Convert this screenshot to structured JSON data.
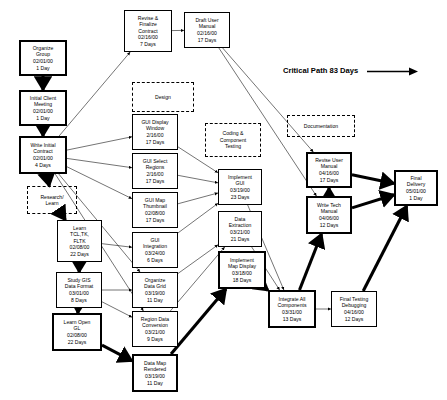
{
  "diagram": {
    "legend": {
      "label": "Critical Path 83 Days",
      "arrow_icon": "right-arrow-icon",
      "x": 283,
      "y": 66
    },
    "phases": [
      {
        "id": "design",
        "label": "Design",
        "x": 132,
        "y": 82,
        "w": 62,
        "h": 30
      },
      {
        "id": "coding",
        "label": "Coding &\nComponent\nTesting",
        "x": 205,
        "y": 123,
        "w": 56,
        "h": 34
      },
      {
        "id": "docs",
        "label": "Documentation",
        "x": 287,
        "y": 115,
        "w": 68,
        "h": 22
      }
    ],
    "nodes": [
      {
        "id": "organize_group",
        "name": "Organize\nGroup",
        "date": "02/01/00",
        "days": "1 Day",
        "x": 19,
        "y": 40,
        "w": 48,
        "h": 36,
        "critical": true
      },
      {
        "id": "initial_meeting",
        "name": "Initial Client\nMeeting",
        "date": "02/01/00",
        "days": "1 Day",
        "x": 19,
        "y": 90,
        "w": 48,
        "h": 36,
        "critical": true
      },
      {
        "id": "write_contract",
        "name": "Write Initial\nContract",
        "date": "02/01/00",
        "days": "4 Days",
        "x": 19,
        "y": 136,
        "w": 48,
        "h": 38,
        "critical": true
      },
      {
        "id": "revise_contract",
        "name": "Revise &\nFinalize\nContract",
        "date": "02/16/00",
        "days": "7 Days",
        "x": 124,
        "y": 10,
        "w": 48,
        "h": 42,
        "critical": false
      },
      {
        "id": "draft_manual",
        "name": "Draft User\nManual",
        "date": "02/16/00",
        "days": "17 Days",
        "x": 184,
        "y": 12,
        "w": 46,
        "h": 36,
        "critical": false
      },
      {
        "id": "research_learn",
        "name": "Research/\nLearn",
        "date": "",
        "days": "",
        "x": 27,
        "y": 186,
        "w": 50,
        "h": 28,
        "critical": false,
        "dashed": true
      },
      {
        "id": "learn_tcl",
        "name": "Learn\nTCL,TK,\nFLTK",
        "date": "02/08/00",
        "days": "22 Days",
        "x": 57,
        "y": 220,
        "w": 45,
        "h": 42,
        "critical": false
      },
      {
        "id": "study_gis",
        "name": "Study GIS\nData Format",
        "date": "03/01/00",
        "days": "8 Days",
        "x": 56,
        "y": 272,
        "w": 46,
        "h": 36,
        "critical": false
      },
      {
        "id": "learn_opengl",
        "name": "Learn Open\nGL",
        "date": "02/08/00",
        "days": "22 Days",
        "x": 52,
        "y": 313,
        "w": 50,
        "h": 38,
        "critical": true
      },
      {
        "id": "gui_display",
        "name": "GUI Display\nWindow",
        "date": "2/16/00",
        "days": "17 Days",
        "x": 132,
        "y": 114,
        "w": 46,
        "h": 36,
        "critical": false
      },
      {
        "id": "gui_select",
        "name": "GUI Select\nRegions",
        "date": "2/16/00",
        "days": "17 Days",
        "x": 132,
        "y": 153,
        "w": 46,
        "h": 36,
        "critical": false
      },
      {
        "id": "gui_thumbnail",
        "name": "GUI Map\nThumbnail",
        "date": "02/08/00",
        "days": "17 Days",
        "x": 132,
        "y": 192,
        "w": 46,
        "h": 36,
        "critical": false
      },
      {
        "id": "gui_integration",
        "name": "GUI\nIntegration",
        "date": "03/24/00",
        "days": "6 Days",
        "x": 132,
        "y": 232,
        "w": 46,
        "h": 36,
        "critical": false
      },
      {
        "id": "organize_grid",
        "name": "Organize\nData Grid",
        "date": "03/19/00",
        "days": "11 Day",
        "x": 132,
        "y": 272,
        "w": 46,
        "h": 36,
        "critical": false
      },
      {
        "id": "region_conv",
        "name": "Region Data\nConversion",
        "date": "03/21/00",
        "days": "9 Days",
        "x": 132,
        "y": 311,
        "w": 46,
        "h": 36,
        "critical": false
      },
      {
        "id": "data_map_render",
        "name": "Data Map\nRendered",
        "date": "03/19/00",
        "days": "11 Day",
        "x": 132,
        "y": 354,
        "w": 46,
        "h": 38,
        "critical": true
      },
      {
        "id": "implement_gui",
        "name": "Implement\nGUI",
        "date": "03/19/00",
        "days": "23 Days",
        "x": 218,
        "y": 169,
        "w": 44,
        "h": 36,
        "critical": false
      },
      {
        "id": "data_extraction",
        "name": "Data\nExtraction",
        "date": "03/21/00",
        "days": "21 Days",
        "x": 218,
        "y": 211,
        "w": 44,
        "h": 36,
        "critical": false
      },
      {
        "id": "implement_map",
        "name": "Implement\nMap Display",
        "date": "03/18/00",
        "days": "18 Days",
        "x": 218,
        "y": 251,
        "w": 48,
        "h": 38,
        "critical": true
      },
      {
        "id": "integrate_all",
        "name": "Integrate All\nComponents",
        "date": "03/31/00",
        "days": "13 Days",
        "x": 268,
        "y": 290,
        "w": 48,
        "h": 38,
        "critical": true
      },
      {
        "id": "final_testing",
        "name": "Final Testing\nDebugging",
        "date": "04/16/00",
        "days": "12 Days",
        "x": 331,
        "y": 291,
        "w": 46,
        "h": 36,
        "critical": false
      },
      {
        "id": "revise_user_man",
        "name": "Revise User\nManual",
        "date": "04/16/00",
        "days": "17 Days",
        "x": 306,
        "y": 152,
        "w": 46,
        "h": 36,
        "critical": true
      },
      {
        "id": "write_tech_man",
        "name": "Write Tech\nManual",
        "date": "04/06/00",
        "days": "12 Days",
        "x": 306,
        "y": 196,
        "w": 46,
        "h": 38,
        "critical": true
      },
      {
        "id": "final_delivery",
        "name": "Final\nDelivery",
        "date": "05/01/00",
        "days": "1 Day",
        "x": 394,
        "y": 170,
        "w": 44,
        "h": 36,
        "critical": true
      }
    ],
    "edges": [
      {
        "from": "organize_group",
        "to": "initial_meeting",
        "critical": true
      },
      {
        "from": "initial_meeting",
        "to": "write_contract",
        "critical": true
      },
      {
        "from": "write_contract",
        "to": "revise_contract",
        "critical": false
      },
      {
        "from": "revise_contract",
        "to": "draft_manual",
        "critical": false
      },
      {
        "from": "write_contract",
        "to": "research_learn",
        "critical": true
      },
      {
        "from": "write_contract",
        "to": "gui_display",
        "critical": false
      },
      {
        "from": "write_contract",
        "to": "gui_select",
        "critical": false
      },
      {
        "from": "write_contract",
        "to": "gui_thumbnail",
        "critical": false
      },
      {
        "from": "write_contract",
        "to": "organize_grid",
        "critical": false
      },
      {
        "from": "write_contract",
        "to": "region_conv",
        "critical": false
      },
      {
        "from": "research_learn",
        "to": "learn_tcl",
        "critical": true
      },
      {
        "from": "learn_tcl",
        "to": "study_gis",
        "critical": true
      },
      {
        "from": "study_gis",
        "to": "learn_opengl",
        "critical": true
      },
      {
        "from": "learn_opengl",
        "to": "data_map_render",
        "critical": true
      },
      {
        "from": "learn_tcl",
        "to": "gui_integration",
        "critical": false
      },
      {
        "from": "study_gis",
        "to": "organize_grid",
        "critical": false
      },
      {
        "from": "study_gis",
        "to": "region_conv",
        "critical": false
      },
      {
        "from": "gui_display",
        "to": "implement_gui",
        "critical": false
      },
      {
        "from": "gui_select",
        "to": "implement_gui",
        "critical": false
      },
      {
        "from": "gui_thumbnail",
        "to": "implement_gui",
        "critical": false
      },
      {
        "from": "gui_integration",
        "to": "implement_gui",
        "critical": false
      },
      {
        "from": "organize_grid",
        "to": "data_extraction",
        "critical": false
      },
      {
        "from": "region_conv",
        "to": "data_extraction",
        "critical": false
      },
      {
        "from": "data_map_render",
        "to": "implement_map",
        "critical": true
      },
      {
        "from": "implement_map",
        "to": "integrate_all",
        "critical": true
      },
      {
        "from": "implement_gui",
        "to": "integrate_all",
        "critical": false
      },
      {
        "from": "data_extraction",
        "to": "integrate_all",
        "critical": false
      },
      {
        "from": "integrate_all",
        "to": "final_testing",
        "critical": false
      },
      {
        "from": "integrate_all",
        "to": "write_tech_man",
        "critical": true
      },
      {
        "from": "write_tech_man",
        "to": "revise_user_man",
        "critical": true
      },
      {
        "from": "revise_user_man",
        "to": "final_delivery",
        "critical": true
      },
      {
        "from": "write_tech_man",
        "to": "final_delivery",
        "critical": true
      },
      {
        "from": "final_testing",
        "to": "final_delivery",
        "critical": true
      },
      {
        "from": "draft_manual",
        "to": "revise_user_man",
        "critical": false
      },
      {
        "from": "draft_manual",
        "to": "write_tech_man",
        "critical": false
      }
    ]
  }
}
